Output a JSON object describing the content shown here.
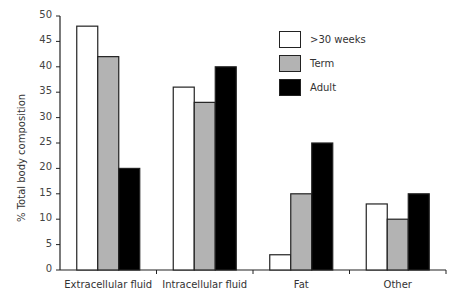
{
  "chart_data": {
    "type": "bar",
    "title": "",
    "xlabel": "",
    "ylabel": "% Total body composition",
    "ylim": [
      0,
      50
    ],
    "yticks": [
      0,
      5,
      10,
      15,
      20,
      25,
      30,
      35,
      40,
      45,
      50
    ],
    "grid": false,
    "legend_position": "top-right",
    "categories": [
      "Extracellular fluid",
      "Intracellular fluid",
      "Fat",
      "Other"
    ],
    "series": [
      {
        "name": ">30 weeks",
        "color": "#ffffff",
        "values": [
          48,
          36,
          3,
          13
        ]
      },
      {
        "name": "Term",
        "color": "#b3b3b3",
        "values": [
          42,
          33,
          15,
          10
        ]
      },
      {
        "name": "Adult",
        "color": "#000000",
        "values": [
          20,
          40,
          25,
          15
        ]
      }
    ]
  }
}
